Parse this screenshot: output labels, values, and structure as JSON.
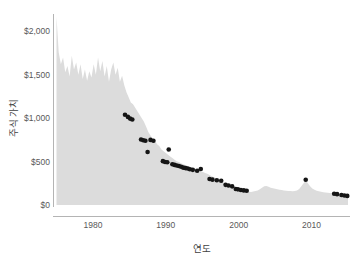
{
  "chart_data": {
    "type": "area",
    "title": "",
    "subtitle": "",
    "xlabel": "연도",
    "ylabel": "주식 가치",
    "xlim": [
      1975,
      2015
    ],
    "ylim": [
      0,
      2200
    ],
    "grid": false,
    "legend": "none",
    "colors": {
      "area_fill": "#dcdcdc",
      "scatter": "#151515",
      "axis": "#b4b4b4",
      "text": "#595959",
      "background": "#ffffff"
    },
    "x_ticks": [
      1980,
      1990,
      2000,
      2010
    ],
    "x_tick_labels": [
      "1980",
      "1990",
      "2000",
      "2010"
    ],
    "y_ticks": [
      0,
      500,
      1000,
      1500,
      2000
    ],
    "y_tick_labels": [
      "$0",
      "$500",
      "$1,000",
      "$1,500",
      "$2,000"
    ],
    "series": [
      {
        "name": "주식 가치",
        "type": "area",
        "x": [
          1975.0,
          1975.3,
          1975.6,
          1975.9,
          1976.2,
          1976.5,
          1976.8,
          1977.1,
          1977.4,
          1977.7,
          1978.0,
          1978.3,
          1978.6,
          1978.9,
          1979.2,
          1979.5,
          1979.8,
          1980.1,
          1980.4,
          1980.7,
          1981.0,
          1981.3,
          1981.6,
          1981.9,
          1982.2,
          1982.5,
          1982.8,
          1983.1,
          1983.4,
          1983.7,
          1984.0,
          1984.3,
          1984.6,
          1984.9,
          1985.2,
          1985.5,
          1985.8,
          1986.1,
          1986.4,
          1986.7,
          1987.0,
          1987.3,
          1987.6,
          1987.9,
          1988.2,
          1988.5,
          1988.8,
          1989.1,
          1989.4,
          1989.7,
          1990.0,
          1990.3,
          1990.6,
          1990.9,
          1991.2,
          1991.5,
          1991.8,
          1992.1,
          1992.4,
          1992.7,
          1993.0,
          1993.3,
          1993.6,
          1993.9,
          1994.2,
          1994.5,
          1994.8,
          1995.1,
          1995.4,
          1995.7,
          1996.0,
          1996.3,
          1996.6,
          1996.9,
          1997.2,
          1997.5,
          1997.8,
          1998.1,
          1998.4,
          1998.7,
          1999.0,
          1999.3,
          1999.6,
          1999.9,
          2000.2,
          2000.5,
          2000.8,
          2001.1,
          2001.4,
          2001.7,
          2002.0,
          2002.3,
          2002.6,
          2002.9,
          2003.2,
          2003.5,
          2003.8,
          2004.1,
          2004.4,
          2004.7,
          2005.0,
          2005.3,
          2005.6,
          2005.9,
          2006.2,
          2006.5,
          2006.8,
          2007.1,
          2007.4,
          2007.7,
          2008.0,
          2008.3,
          2008.6,
          2008.9,
          2009.2,
          2009.5,
          2009.8,
          2010.1,
          2010.4,
          2010.7,
          2011.0,
          2011.3,
          2011.6,
          2011.9,
          2012.2,
          2012.5,
          2012.8,
          2013.1,
          2013.4,
          2013.7,
          2014.0,
          2014.3,
          2014.6,
          2014.9,
          2015.0
        ],
        "y": [
          2170,
          1760,
          1620,
          1700,
          1530,
          1600,
          1480,
          1720,
          1560,
          1640,
          1500,
          1620,
          1450,
          1560,
          1430,
          1540,
          1470,
          1620,
          1500,
          1700,
          1540,
          1660,
          1480,
          1600,
          1420,
          1560,
          1640,
          1500,
          1580,
          1420,
          1490,
          1380,
          1300,
          1240,
          1180,
          1160,
          1120,
          1080,
          1040,
          1000,
          960,
          900,
          840,
          800,
          760,
          740,
          700,
          680,
          640,
          620,
          600,
          580,
          560,
          540,
          520,
          505,
          495,
          480,
          470,
          460,
          450,
          440,
          430,
          420,
          410,
          400,
          390,
          380,
          370,
          360,
          345,
          330,
          320,
          305,
          290,
          280,
          265,
          250,
          240,
          225,
          215,
          200,
          190,
          180,
          172,
          165,
          160,
          155,
          152,
          150,
          155,
          160,
          168,
          180,
          200,
          215,
          218,
          210,
          200,
          192,
          186,
          180,
          176,
          172,
          168,
          165,
          162,
          160,
          158,
          160,
          168,
          185,
          215,
          250,
          280,
          250,
          215,
          190,
          175,
          165,
          158,
          152,
          148,
          145,
          142,
          138,
          135,
          130,
          125,
          120,
          115,
          110,
          105,
          100,
          98
        ]
      },
      {
        "name": "관측 데이터",
        "type": "scatter",
        "points": [
          {
            "x": 1984.4,
            "y": 1040
          },
          {
            "x": 1984.8,
            "y": 1015
          },
          {
            "x": 1985.1,
            "y": 995
          },
          {
            "x": 1985.4,
            "y": 985
          },
          {
            "x": 1986.6,
            "y": 755
          },
          {
            "x": 1986.9,
            "y": 745
          },
          {
            "x": 1987.2,
            "y": 740
          },
          {
            "x": 1987.5,
            "y": 610
          },
          {
            "x": 1987.9,
            "y": 750
          },
          {
            "x": 1988.3,
            "y": 740
          },
          {
            "x": 1990.4,
            "y": 640
          },
          {
            "x": 1989.6,
            "y": 505
          },
          {
            "x": 1989.9,
            "y": 495
          },
          {
            "x": 1990.2,
            "y": 492
          },
          {
            "x": 1990.9,
            "y": 470
          },
          {
            "x": 1991.2,
            "y": 462
          },
          {
            "x": 1991.5,
            "y": 455
          },
          {
            "x": 1991.8,
            "y": 450
          },
          {
            "x": 1992.1,
            "y": 440
          },
          {
            "x": 1992.4,
            "y": 430
          },
          {
            "x": 1992.7,
            "y": 425
          },
          {
            "x": 1993.0,
            "y": 420
          },
          {
            "x": 1993.3,
            "y": 412
          },
          {
            "x": 1993.7,
            "y": 405
          },
          {
            "x": 1994.3,
            "y": 395
          },
          {
            "x": 1994.8,
            "y": 415
          },
          {
            "x": 1996.0,
            "y": 300
          },
          {
            "x": 1996.4,
            "y": 292
          },
          {
            "x": 1997.0,
            "y": 285
          },
          {
            "x": 1997.6,
            "y": 280
          },
          {
            "x": 1998.2,
            "y": 232
          },
          {
            "x": 1998.6,
            "y": 225
          },
          {
            "x": 1999.1,
            "y": 215
          },
          {
            "x": 1999.6,
            "y": 185
          },
          {
            "x": 1999.9,
            "y": 180
          },
          {
            "x": 2000.3,
            "y": 172
          },
          {
            "x": 2000.7,
            "y": 168
          },
          {
            "x": 2001.1,
            "y": 165
          },
          {
            "x": 2009.2,
            "y": 290
          },
          {
            "x": 2013.1,
            "y": 130
          },
          {
            "x": 2013.5,
            "y": 125
          },
          {
            "x": 2014.1,
            "y": 115
          },
          {
            "x": 2014.5,
            "y": 110
          },
          {
            "x": 2014.9,
            "y": 105
          }
        ]
      }
    ]
  }
}
